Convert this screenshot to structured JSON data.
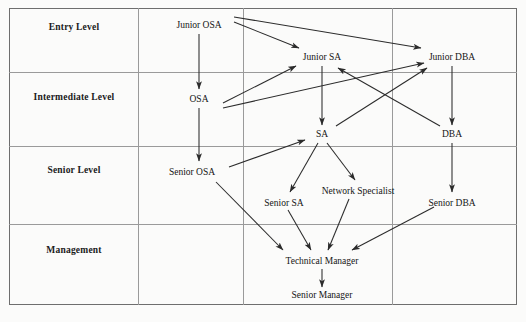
{
  "diagram": {
    "type": "flow-grid",
    "levels": [
      {
        "id": "entry",
        "label": "Entry Level"
      },
      {
        "id": "intermediate",
        "label": "Intermediate Level"
      },
      {
        "id": "senior",
        "label": "Senior Level"
      },
      {
        "id": "management",
        "label": "Management"
      }
    ],
    "nodes": [
      {
        "id": "junior-osa",
        "label": "Junior OSA",
        "level": "entry",
        "x": 199,
        "y": 25
      },
      {
        "id": "junior-sa",
        "label": "Junior SA",
        "level": "entry",
        "x": 322,
        "y": 57
      },
      {
        "id": "junior-dba",
        "label": "Junior DBA",
        "level": "entry",
        "x": 452,
        "y": 57
      },
      {
        "id": "osa",
        "label": "OSA",
        "level": "intermediate",
        "x": 199,
        "y": 99
      },
      {
        "id": "sa",
        "label": "SA",
        "level": "intermediate",
        "x": 322,
        "y": 134
      },
      {
        "id": "dba",
        "label": "DBA",
        "level": "intermediate",
        "x": 452,
        "y": 134
      },
      {
        "id": "senior-osa",
        "label": "Senior OSA",
        "level": "senior",
        "x": 192,
        "y": 172
      },
      {
        "id": "senior-sa",
        "label": "Senior SA",
        "level": "senior",
        "x": 284,
        "y": 203
      },
      {
        "id": "network-specialist",
        "label": "Network Specialist",
        "level": "senior",
        "x": 358,
        "y": 191
      },
      {
        "id": "senior-dba",
        "label": "Senior DBA",
        "level": "senior",
        "x": 452,
        "y": 203
      },
      {
        "id": "technical-manager",
        "label": "Technical Manager",
        "level": "management",
        "x": 322,
        "y": 261
      },
      {
        "id": "senior-manager",
        "label": "Senior Manager",
        "level": "management",
        "x": 322,
        "y": 295
      }
    ],
    "edges": [
      {
        "from": "junior-osa",
        "to": "junior-sa"
      },
      {
        "from": "junior-osa",
        "to": "junior-dba"
      },
      {
        "from": "junior-osa",
        "to": "osa"
      },
      {
        "from": "osa",
        "to": "junior-sa"
      },
      {
        "from": "osa",
        "to": "junior-dba"
      },
      {
        "from": "osa",
        "to": "senior-osa"
      },
      {
        "from": "junior-sa",
        "to": "sa"
      },
      {
        "from": "junior-dba",
        "to": "dba"
      },
      {
        "from": "sa",
        "to": "junior-dba"
      },
      {
        "from": "dba",
        "to": "junior-sa"
      },
      {
        "from": "senior-osa",
        "to": "sa"
      },
      {
        "from": "senior-osa",
        "to": "technical-manager"
      },
      {
        "from": "sa",
        "to": "senior-sa"
      },
      {
        "from": "sa",
        "to": "network-specialist"
      },
      {
        "from": "dba",
        "to": "senior-dba"
      },
      {
        "from": "senior-sa",
        "to": "technical-manager"
      },
      {
        "from": "network-specialist",
        "to": "technical-manager"
      },
      {
        "from": "senior-dba",
        "to": "technical-manager"
      },
      {
        "from": "technical-manager",
        "to": "senior-manager"
      }
    ],
    "colors": {
      "arrow": "#2b2b2b",
      "grid": "#9a9a9a",
      "border": "#6e6e6e",
      "text": "#151515",
      "background": "#fbfbfa"
    }
  }
}
